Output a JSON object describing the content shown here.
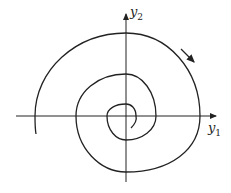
{
  "diagram": {
    "type": "phase-portrait-spiral",
    "axes": {
      "x_label": "y",
      "x_sub": "1",
      "y_label": "y",
      "y_sub": "2"
    },
    "direction": "clockwise",
    "colors": {
      "stroke": "#222222"
    }
  }
}
